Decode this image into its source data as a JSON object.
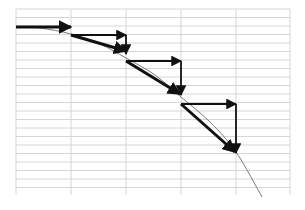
{
  "diagram": {
    "grid": {
      "x_start": 16,
      "x_end": 290,
      "y_start": 9,
      "y_end": 195,
      "vertical_lines": [
        16,
        71,
        126,
        181,
        236,
        290
      ],
      "row_spacing": 8.5,
      "color": "#d6d6d6"
    },
    "curve": {
      "color": "#7a7a7a",
      "points": [
        [
          16,
          27
        ],
        [
          40,
          28
        ],
        [
          71,
          34
        ],
        [
          100,
          44
        ],
        [
          126,
          58
        ],
        [
          155,
          75
        ],
        [
          181,
          97
        ],
        [
          210,
          122
        ],
        [
          236,
          152
        ],
        [
          262,
          197
        ]
      ]
    },
    "arrows": [
      {
        "name": "initial-horizontal",
        "x1": 16,
        "y1": 27,
        "x2": 71,
        "y2": 27,
        "width": 3
      },
      {
        "name": "step1-horizontal",
        "x1": 71,
        "y1": 35,
        "x2": 126,
        "y2": 35,
        "width": 1.8
      },
      {
        "name": "step1-vertical",
        "x1": 126,
        "y1": 35,
        "x2": 126,
        "y2": 54,
        "width": 1.8
      },
      {
        "name": "step1-resultant",
        "x1": 71,
        "y1": 35,
        "x2": 126,
        "y2": 51,
        "width": 3
      },
      {
        "name": "step2-horizontal",
        "x1": 126,
        "y1": 61,
        "x2": 181,
        "y2": 61,
        "width": 1.8
      },
      {
        "name": "step2-vertical",
        "x1": 181,
        "y1": 61,
        "x2": 181,
        "y2": 95,
        "width": 1.8
      },
      {
        "name": "step2-resultant",
        "x1": 126,
        "y1": 61,
        "x2": 180,
        "y2": 94,
        "width": 3
      },
      {
        "name": "step3-horizontal",
        "x1": 181,
        "y1": 104,
        "x2": 236,
        "y2": 104,
        "width": 1.8
      },
      {
        "name": "step3-vertical",
        "x1": 236,
        "y1": 104,
        "x2": 236,
        "y2": 153,
        "width": 1.8
      },
      {
        "name": "step3-resultant",
        "x1": 181,
        "y1": 104,
        "x2": 235,
        "y2": 152,
        "width": 3
      }
    ],
    "arrow_color": "#111111"
  }
}
